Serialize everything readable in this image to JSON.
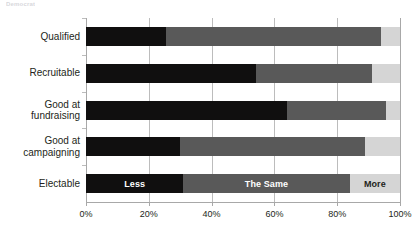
{
  "top_caption": "Democrat",
  "chart_data": {
    "type": "bar",
    "orientation": "horizontal",
    "stacked": true,
    "normalized": true,
    "title": "",
    "subtitle": "",
    "xlabel": "",
    "ylabel": "",
    "xlim": [
      0,
      100
    ],
    "grid": true,
    "legend_position": "in-bar",
    "categories": [
      "Qualified",
      "Recruitable",
      "Good at\nfundraising",
      "Good at\ncampaigning",
      "Electable"
    ],
    "tick_labels": [
      "0%",
      "20%",
      "40%",
      "60%",
      "80%",
      "100%"
    ],
    "tick_values": [
      0,
      20,
      40,
      60,
      80,
      100
    ],
    "series": [
      {
        "name": "Less",
        "color": "#100f0f",
        "values": [
          25.5,
          54.0,
          64.0,
          30.0,
          31.0
        ]
      },
      {
        "name": "The Same",
        "color": "#595959",
        "values": [
          68.5,
          37.0,
          31.5,
          59.0,
          53.0
        ]
      },
      {
        "name": "More",
        "color": "#d5d5d5",
        "values": [
          6.0,
          9.0,
          4.5,
          11.0,
          16.0
        ]
      }
    ],
    "inline_legend_row": "Electable",
    "inline_legend_labels": [
      "Less",
      "The Same",
      "More"
    ]
  }
}
